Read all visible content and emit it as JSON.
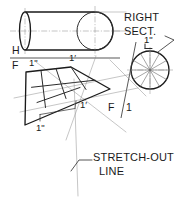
{
  "drawing": {
    "title": "Right Section and Stretch-Out Line Development",
    "background_color": "#ffffff",
    "ink_color": "#1a1a1a",
    "construction_color": "#8c8c8c"
  },
  "annotations": {
    "right_section_line1": "RIGHT",
    "right_section_line2": "SECT.",
    "stretch_out_line1": "STRETCH-OUT",
    "stretch_out_line2": "LINE",
    "ref_h": "H",
    "ref_f": "F",
    "ref_f_lower": "F",
    "ref_1_lower": "1",
    "element_double_prime_section": "1ʺ",
    "element_double_prime_dev_left": "1ʺ",
    "element_double_prime_dev_bottom": "1ʺ",
    "element_prime_dev_top": "1′",
    "element_prime_dev_bottom": "1′"
  },
  "views": {
    "top_view": {
      "name": "cylinder-top-view",
      "description": "Cylinder shown above the H/F reference line",
      "left_ellipse_rx": 5,
      "left_ellipse_ry": 21,
      "right_ellipse_rx": 18,
      "right_ellipse_ry": 21
    },
    "right_section": {
      "name": "right-section-circle",
      "radius": 19,
      "divisions": 12
    },
    "development": {
      "name": "stretch-out-development",
      "shape": "trapezoid",
      "grid_columns": 3,
      "grid_rows": 2
    }
  }
}
